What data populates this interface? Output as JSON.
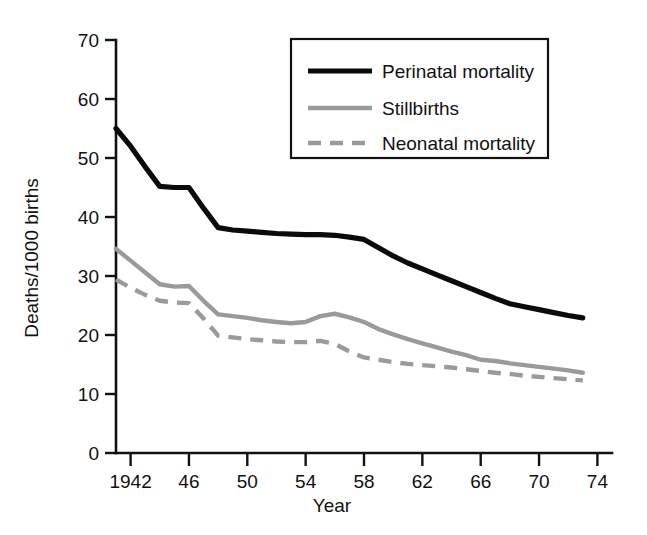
{
  "chart_data": {
    "type": "line",
    "title": "",
    "xlabel": "Year",
    "ylabel": "Deaths/1000 births",
    "xlim": [
      1941,
      1975
    ],
    "ylim": [
      0,
      70
    ],
    "grid": false,
    "legend_position": "top-right",
    "y_ticks": [
      0,
      10,
      20,
      30,
      40,
      50,
      60,
      70
    ],
    "y_tick_labels": [
      "0",
      "10",
      "20",
      "30",
      "40",
      "50",
      "60",
      "70"
    ],
    "x_ticks": [
      1942,
      1946,
      1950,
      1954,
      1958,
      1962,
      1966,
      1970,
      1974
    ],
    "x_tick_labels": [
      "1942",
      "46",
      "50",
      "54",
      "58",
      "62",
      "66",
      "70",
      "74"
    ],
    "x": [
      1941,
      1942,
      1943,
      1944,
      1945,
      1946,
      1947,
      1948,
      1949,
      1950,
      1951,
      1952,
      1953,
      1954,
      1955,
      1956,
      1957,
      1958,
      1959,
      1960,
      1961,
      1962,
      1963,
      1964,
      1965,
      1966,
      1967,
      1968,
      1969,
      1970,
      1971,
      1972,
      1973
    ],
    "series": [
      {
        "name": "Perinatal mortality",
        "style": "solid",
        "color": "#0b0b0b",
        "values": [
          55.0,
          52.0,
          48.5,
          45.2,
          45.0,
          45.0,
          41.5,
          38.2,
          37.8,
          37.6,
          37.4,
          37.2,
          37.1,
          37.0,
          37.0,
          36.9,
          36.6,
          36.2,
          34.8,
          33.4,
          32.2,
          31.2,
          30.2,
          29.2,
          28.2,
          27.2,
          26.2,
          25.3,
          24.8,
          24.3,
          23.8,
          23.3,
          22.9
        ]
      },
      {
        "name": "Stillbirths",
        "style": "solid",
        "color": "#9a9a9a",
        "values": [
          34.6,
          32.6,
          30.6,
          28.6,
          28.2,
          28.3,
          25.8,
          23.5,
          23.2,
          22.9,
          22.5,
          22.2,
          22.0,
          22.2,
          23.2,
          23.6,
          23.0,
          22.2,
          21.0,
          20.1,
          19.3,
          18.6,
          17.9,
          17.2,
          16.6,
          15.8,
          15.6,
          15.2,
          14.9,
          14.6,
          14.3,
          14.0,
          13.6
        ]
      },
      {
        "name": "Neonatal mortality",
        "style": "dashed",
        "color": "#9a9a9a",
        "values": [
          29.4,
          28.0,
          26.8,
          25.8,
          25.5,
          25.4,
          22.8,
          19.9,
          19.6,
          19.3,
          19.1,
          18.9,
          18.8,
          18.8,
          19.0,
          18.5,
          17.2,
          16.2,
          15.8,
          15.4,
          15.1,
          14.9,
          14.7,
          14.5,
          14.2,
          13.9,
          13.6,
          13.4,
          13.1,
          12.9,
          12.7,
          12.5,
          12.3
        ]
      }
    ]
  },
  "legend": {
    "items": [
      {
        "label": "Perinatal mortality"
      },
      {
        "label": "Stillbirths"
      },
      {
        "label": "Neonatal mortality"
      }
    ]
  },
  "colors": {
    "axis": "#111111",
    "perinatal": "#0b0b0b",
    "gray_series": "#9a9a9a",
    "background": "#ffffff"
  }
}
